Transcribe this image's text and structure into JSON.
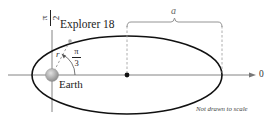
{
  "diagram": {
    "title_label": "Explorer 18",
    "earth_label": "Earth",
    "radius_label": "r",
    "angle_label": {
      "numerator": "π",
      "denominator": "3"
    },
    "vertical_axis_label": {
      "numerator": "π",
      "denominator": "2"
    },
    "polar_axis_label": "0",
    "semi_major_label": "a",
    "note": "Not drawn to scale"
  },
  "colors": {
    "ellipse": "#111111",
    "axis": "#777777",
    "dashed": "#999999",
    "earth": "#a8a8a8",
    "text": "#222222"
  }
}
